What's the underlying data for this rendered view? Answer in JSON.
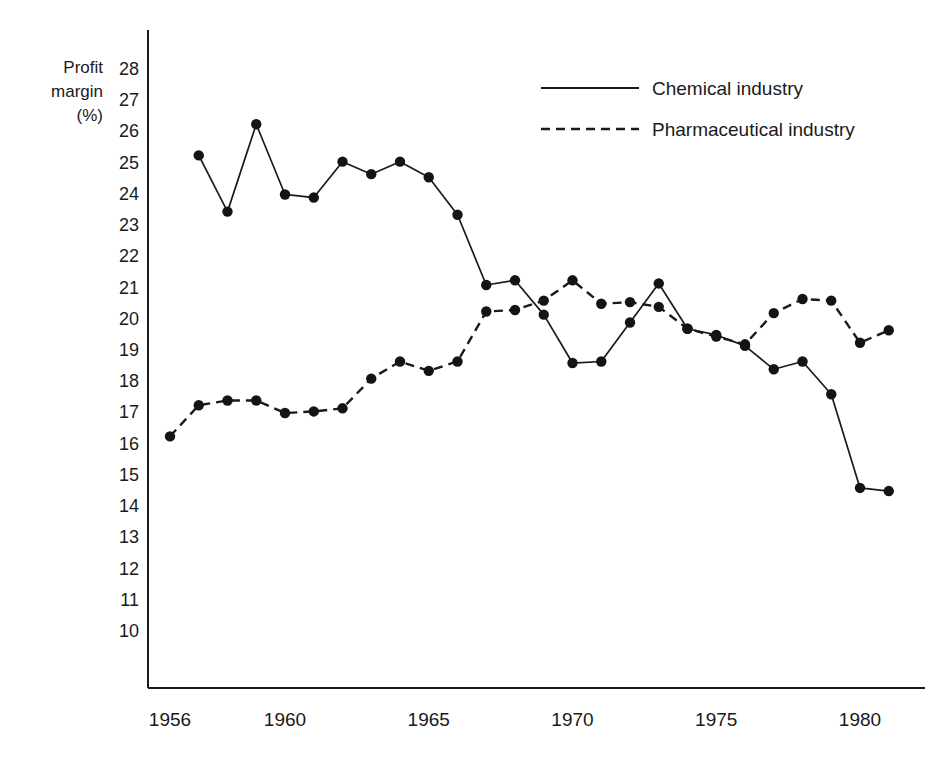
{
  "chart_data": {
    "type": "line",
    "title": "",
    "xlabel": "",
    "ylabel": "Profit margin (%)",
    "ylabel_lines": [
      "Profit",
      "margin",
      "(%)"
    ],
    "x": [
      1956,
      1957,
      1958,
      1959,
      1960,
      1961,
      1962,
      1963,
      1964,
      1965,
      1966,
      1967,
      1968,
      1969,
      1970,
      1971,
      1972,
      1973,
      1974,
      1975,
      1976,
      1977,
      1978,
      1979,
      1980,
      1981
    ],
    "xlim": [
      1955.4,
      1981.8
    ],
    "ylim": [
      9.2,
      28.6
    ],
    "y_ticks": [
      28,
      27,
      26,
      25,
      24,
      23,
      22,
      21,
      20,
      19,
      18,
      17,
      16,
      15,
      14,
      13,
      12,
      11,
      10
    ],
    "x_ticks": [
      1956,
      1960,
      1965,
      1970,
      1975,
      1980
    ],
    "x_tick_labels": [
      "1956",
      "1960",
      "1965",
      "1970",
      "1975",
      "1980"
    ],
    "grid": false,
    "legend_position": "top-right",
    "series": [
      {
        "name": "Chemical industry",
        "style": "solid",
        "marker": "circle",
        "color": "#1a1a1a",
        "x": [
          1957,
          1958,
          1959,
          1960,
          1961,
          1962,
          1963,
          1964,
          1965,
          1966,
          1967,
          1968,
          1969,
          1970,
          1971,
          1972,
          1973,
          1974,
          1975,
          1976,
          1977,
          1978,
          1979,
          1980,
          1981
        ],
        "values": [
          25.2,
          23.4,
          26.2,
          23.95,
          23.85,
          25.0,
          24.6,
          25.0,
          24.5,
          23.3,
          21.05,
          21.2,
          20.1,
          18.55,
          18.6,
          19.85,
          21.1,
          19.65,
          19.45,
          19.1,
          18.35,
          18.6,
          17.55,
          14.55,
          14.45
        ]
      },
      {
        "name": "Pharmaceutical industry",
        "style": "dashed",
        "marker": "circle",
        "color": "#1a1a1a",
        "x": [
          1956,
          1957,
          1958,
          1959,
          1960,
          1961,
          1962,
          1963,
          1964,
          1965,
          1966,
          1967,
          1968,
          1969,
          1970,
          1971,
          1972,
          1973,
          1974,
          1975,
          1976,
          1977,
          1978,
          1979,
          1980,
          1981
        ],
        "values": [
          16.2,
          17.2,
          17.35,
          17.35,
          16.95,
          17.0,
          17.1,
          18.05,
          18.6,
          18.3,
          18.6,
          20.2,
          20.25,
          20.55,
          21.2,
          20.45,
          20.5,
          20.35,
          19.65,
          19.4,
          19.15,
          20.15,
          20.6,
          20.55,
          19.2,
          19.6
        ]
      }
    ],
    "legend": [
      {
        "label": "Chemical industry",
        "style": "solid"
      },
      {
        "label": "Pharmaceutical industry",
        "style": "dashed"
      }
    ]
  }
}
